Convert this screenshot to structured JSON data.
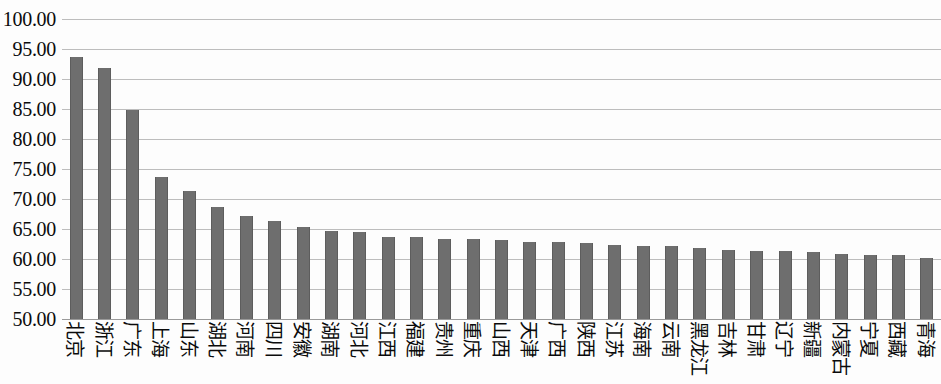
{
  "chart_data": {
    "type": "bar",
    "title": "",
    "subtitle": "",
    "xlabel": "",
    "ylabel": "",
    "ylim": [
      50.0,
      100.0
    ],
    "ytick_step": 5.0,
    "grid": "horizontal",
    "legend": "none",
    "bar_color": "#6e6e6e",
    "gridline_color": "#bdbdbd",
    "ytick_labels": [
      "100.00",
      "95.00",
      "90.00",
      "85.00",
      "80.00",
      "75.00",
      "70.00",
      "65.00",
      "60.00",
      "55.00",
      "50.00"
    ],
    "ytick_values": [
      100.0,
      95.0,
      90.0,
      85.0,
      80.0,
      75.0,
      70.0,
      65.0,
      60.0,
      55.0,
      50.0
    ],
    "categories": [
      "北京",
      "浙江",
      "广东",
      "上海",
      "山东",
      "湖北",
      "河南",
      "四川",
      "安徽",
      "湖南",
      "河北",
      "江西",
      "福建",
      "贵州",
      "重庆",
      "山西",
      "天津",
      "广西",
      "陕西",
      "江苏",
      "海南",
      "云南",
      "黑龙江",
      "吉林",
      "甘肃",
      "辽宁",
      "新疆",
      "内蒙古",
      "宁夏",
      "西藏",
      "青海"
    ],
    "values": [
      93.6,
      91.8,
      84.9,
      73.6,
      71.4,
      68.6,
      67.2,
      66.4,
      65.4,
      64.7,
      64.5,
      63.6,
      63.6,
      63.4,
      63.3,
      63.2,
      62.9,
      62.8,
      62.7,
      62.4,
      62.2,
      62.1,
      61.9,
      61.5,
      61.4,
      61.3,
      61.1,
      60.8,
      60.7,
      60.6,
      60.2
    ]
  }
}
